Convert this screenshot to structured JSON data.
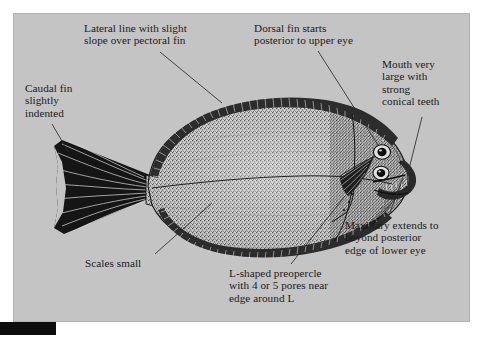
{
  "figure": {
    "type": "labelled-scientific-illustration",
    "background_color": "#c4c4c4",
    "ink_color": "#1a1a1a",
    "page_color": "#ffffff",
    "scale_bar_color": "#0d0d0d"
  },
  "callouts": [
    {
      "id": "lateral-line",
      "text": "Lateral line with slight\nslope over pectoral fin",
      "x": 84,
      "y": 22,
      "leader": {
        "x1": 160,
        "y1": 52,
        "x2": 222,
        "y2": 103
      }
    },
    {
      "id": "dorsal-fin",
      "text": "Dorsal fin starts\nposterior to upper eye",
      "x": 254,
      "y": 22,
      "leader": {
        "x1": 318,
        "y1": 51,
        "x2": 378,
        "y2": 145
      }
    },
    {
      "id": "mouth",
      "text": "Mouth very\nlarge with\nstrong\nconical teeth",
      "x": 382,
      "y": 58,
      "leader": {
        "x1": 422,
        "y1": 117,
        "x2": 409,
        "y2": 169
      }
    },
    {
      "id": "caudal-fin",
      "text": "Caudal fin\nslightly\nindented",
      "x": 25,
      "y": 82,
      "leader": {
        "x1": 52,
        "y1": 124,
        "x2": 69,
        "y2": 153
      }
    },
    {
      "id": "maxillary",
      "text": "Maxillary extends to\nbeyond posterior\nedge of lower eye",
      "x": 345,
      "y": 219,
      "leader": {
        "x1": 389,
        "y1": 215,
        "x2": 403,
        "y2": 178
      }
    },
    {
      "id": "scales",
      "text": "Scales small",
      "x": 85,
      "y": 257,
      "leader": {
        "x1": 155,
        "y1": 254,
        "x2": 212,
        "y2": 203
      }
    },
    {
      "id": "preopercle",
      "text": "L-shaped preopercle\nwith 4 or 5 pores near\nedge around L",
      "x": 229,
      "y": 267,
      "leader": {
        "x1": 291,
        "y1": 264,
        "x2": 345,
        "y2": 196
      }
    }
  ]
}
